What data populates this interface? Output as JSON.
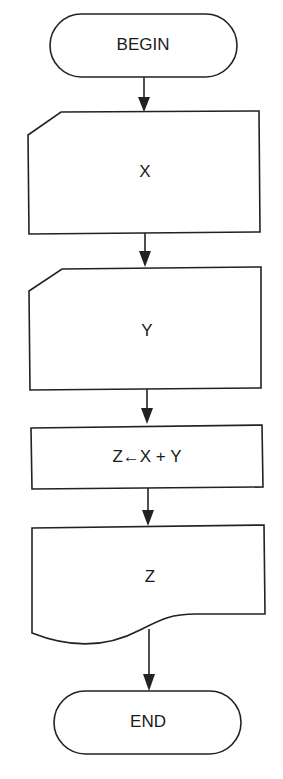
{
  "flowchart": {
    "nodes": [
      {
        "id": "begin",
        "type": "terminator",
        "label": "BEGIN"
      },
      {
        "id": "input_x",
        "type": "punched-card-input",
        "label": "X"
      },
      {
        "id": "input_y",
        "type": "punched-card-input",
        "label": "Y"
      },
      {
        "id": "compute",
        "type": "process",
        "label": "Z←X + Y"
      },
      {
        "id": "output_z",
        "type": "document-output",
        "label": "Z"
      },
      {
        "id": "end",
        "type": "terminator",
        "label": "END"
      }
    ],
    "edges": [
      {
        "from": "begin",
        "to": "input_x"
      },
      {
        "from": "input_x",
        "to": "input_y"
      },
      {
        "from": "input_y",
        "to": "compute"
      },
      {
        "from": "compute",
        "to": "output_z"
      },
      {
        "from": "output_z",
        "to": "end"
      }
    ],
    "colors": {
      "stroke": "#222222",
      "fill": "#ffffff",
      "text": "#1a1a1a"
    }
  }
}
